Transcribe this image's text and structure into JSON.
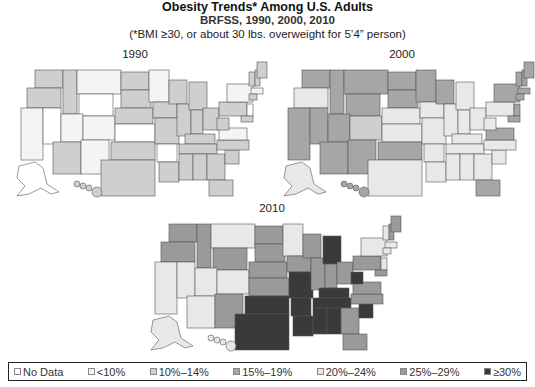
{
  "header": {
    "title": "Obesity Trends* Among U.S. Adults",
    "subtitle": "BRFSS, 1990, 2000, 2010",
    "note": "(*BMI ≥30, or about 30 lbs. overweight for 5’4” person)"
  },
  "legend": {
    "items": [
      {
        "key": "nodata",
        "label": "No Data",
        "color": "#ffffff"
      },
      {
        "key": "lt10",
        "label": "<10%",
        "color": "#f4f4f4"
      },
      {
        "key": "10_14",
        "label": "10%–14%",
        "color": "#cfcfcf"
      },
      {
        "key": "15_19",
        "label": "15%–19%",
        "color": "#a6a6a6"
      },
      {
        "key": "20_24",
        "label": "20%–24%",
        "color": "#e8e8e8"
      },
      {
        "key": "25_29",
        "label": "25%–29%",
        "color": "#9a9a9a"
      },
      {
        "key": "gte30",
        "label": "≥30%",
        "color": "#3a3a3a"
      }
    ]
  },
  "maps": [
    {
      "year": "1990",
      "states": {
        "WA": "10_14",
        "OR": "10_14",
        "CA": "lt10",
        "NV": "nodata",
        "ID": "10_14",
        "MT": "lt10",
        "WY": "nodata",
        "UT": "lt10",
        "AZ": "10_14",
        "CO": "lt10",
        "NM": "lt10",
        "ND": "10_14",
        "SD": "10_14",
        "NE": "10_14",
        "KS": "nodata",
        "OK": "10_14",
        "TX": "10_14",
        "MN": "lt10",
        "IA": "10_14",
        "MO": "10_14",
        "AR": "nodata",
        "LA": "10_14",
        "WI": "10_14",
        "IL": "10_14",
        "MI": "10_14",
        "IN": "10_14",
        "OH": "10_14",
        "KY": "10_14",
        "TN": "10_14",
        "MS": "10_14",
        "AL": "10_14",
        "GA": "10_14",
        "FL": "10_14",
        "SC": "10_14",
        "NC": "10_14",
        "VA": "lt10",
        "WV": "10_14",
        "PA": "10_14",
        "NY": "lt10",
        "VT": "10_14",
        "NH": "10_14",
        "ME": "10_14",
        "MA": "lt10",
        "CT": "10_14",
        "NJ": "nodata",
        "MD": "10_14",
        "AK": "nodata",
        "HI": "10_14"
      }
    },
    {
      "year": "2000",
      "states": {
        "WA": "15_19",
        "OR": "lt10_2000",
        "CA": "15_19",
        "NV": "15_19",
        "ID": "15_19",
        "MT": "15_19",
        "WY": "15_19",
        "UT": "15_19",
        "AZ": "15_19",
        "CO": "10_14",
        "NM": "15_19",
        "ND": "15_19",
        "SD": "15_19",
        "NE": "20_24",
        "KS": "20_24",
        "OK": "15_19",
        "TX": "20_24",
        "MN": "15_19",
        "IA": "20_24",
        "MO": "20_24",
        "AR": "20_24",
        "LA": "20_24",
        "WI": "15_19",
        "IL": "20_24",
        "MI": "20_24",
        "IN": "20_24",
        "OH": "20_24",
        "KY": "20_24",
        "TN": "20_24",
        "MS": "20_24",
        "AL": "20_24",
        "GA": "20_24",
        "FL": "15_19",
        "SC": "20_24",
        "NC": "20_24",
        "VA": "15_19",
        "WV": "20_24",
        "PA": "20_24",
        "NY": "15_19",
        "VT": "15_19",
        "NH": "15_19",
        "ME": "15_19",
        "MA": "15_19",
        "CT": "15_19",
        "NJ": "15_19",
        "MD": "15_19",
        "AK": "20_24",
        "HI": "15_19"
      }
    },
    {
      "year": "2010",
      "states": {
        "WA": "25_29",
        "OR": "25_29",
        "CA": "20_24",
        "NV": "20_24",
        "ID": "25_29",
        "MT": "20_24",
        "WY": "25_29",
        "UT": "20_24",
        "AZ": "20_24",
        "CO": "20_24",
        "NM": "25_29",
        "ND": "25_29",
        "SD": "25_29",
        "NE": "25_29",
        "KS": "25_29",
        "OK": "gte30",
        "TX": "gte30",
        "MN": "20_24",
        "IA": "25_29",
        "MO": "gte30",
        "AR": "gte30",
        "LA": "gte30",
        "WI": "25_29",
        "IL": "25_29",
        "MI": "gte30",
        "IN": "25_29",
        "OH": "25_29",
        "KY": "gte30",
        "TN": "gte30",
        "MS": "gte30",
        "AL": "gte30",
        "GA": "25_29",
        "FL": "25_29",
        "SC": "gte30",
        "NC": "25_29",
        "VA": "25_29",
        "WV": "gte30",
        "PA": "25_29",
        "NY": "20_24",
        "VT": "20_24",
        "NH": "25_29",
        "ME": "25_29",
        "MA": "20_24",
        "CT": "20_24",
        "NJ": "20_24",
        "MD": "25_29",
        "AK": "20_24",
        "HI": "20_24"
      }
    }
  ]
}
